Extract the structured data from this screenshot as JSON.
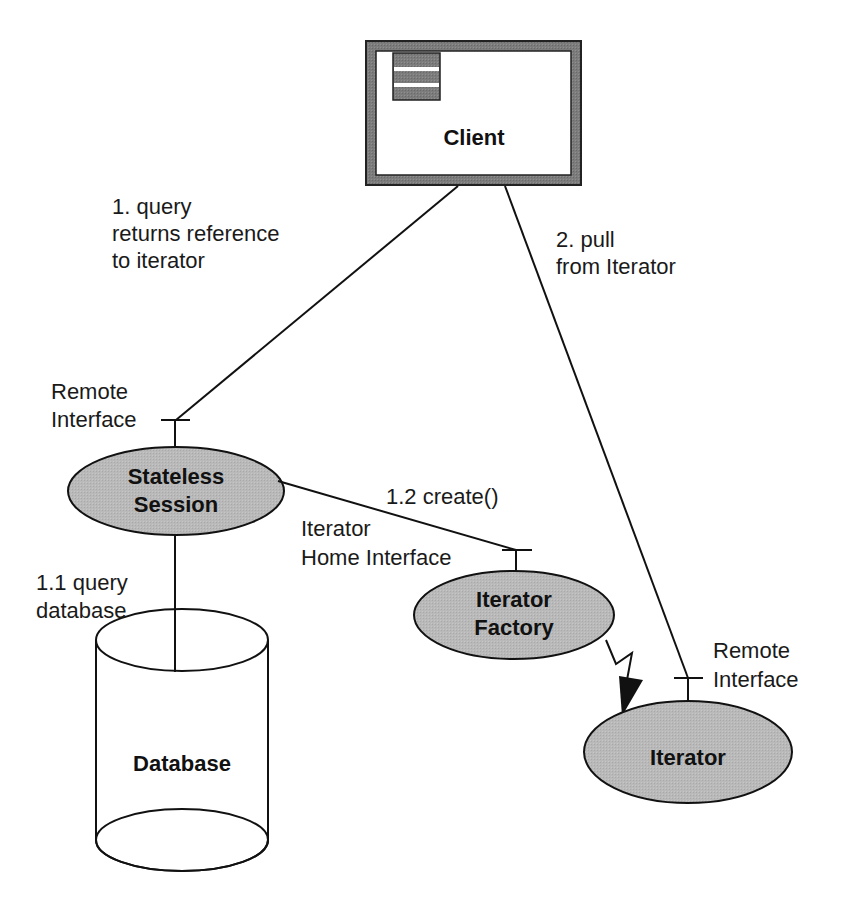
{
  "diagram": {
    "nodes": {
      "client": {
        "label": "Client",
        "shape": "window-box"
      },
      "stateless_session": {
        "line1": "Stateless",
        "line2": "Session",
        "shape": "ellipse"
      },
      "iterator_factory": {
        "line1": "Iterator",
        "line2": "Factory",
        "shape": "ellipse"
      },
      "iterator": {
        "label": "Iterator",
        "shape": "ellipse"
      },
      "database": {
        "label": "Database",
        "shape": "cylinder"
      }
    },
    "labels": {
      "query": {
        "line1": "1. query",
        "line2": "returns reference",
        "line3": "to iterator"
      },
      "pull": {
        "line1": "2. pull",
        "line2": "from Iterator"
      },
      "session_remote": {
        "line1": "Remote",
        "line2": "Interface"
      },
      "create": {
        "text": "1.2 create()"
      },
      "home_interface": {
        "line1": "Iterator",
        "line2": "Home Interface"
      },
      "query_db": {
        "line1": "1.1 query",
        "line2": "database"
      },
      "iterator_remote": {
        "line1": "Remote",
        "line2": "Interface"
      }
    },
    "colors": {
      "ellipse_fill": "#b8b8b8",
      "frame_fill": "#7a7a7a",
      "stroke": "#1a1a1a",
      "background": "#ffffff"
    }
  }
}
